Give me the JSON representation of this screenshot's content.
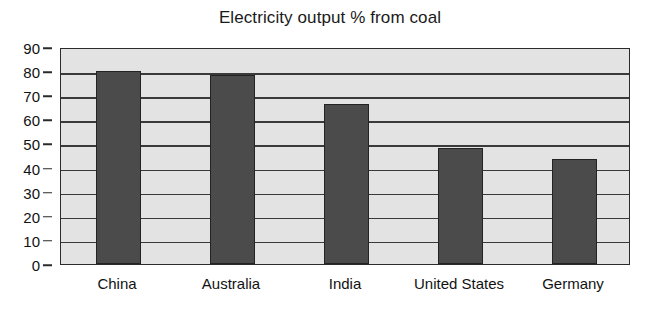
{
  "chart_data": {
    "type": "bar",
    "title": "Electricity output % from coal",
    "xlabel": "",
    "ylabel": "",
    "categories": [
      "China",
      "Australia",
      "India",
      "United States",
      "Germany"
    ],
    "values": [
      80,
      78.5,
      66.5,
      48,
      43.5
    ],
    "ylim": [
      0,
      90
    ],
    "ytick_step": 10,
    "yticks": [
      0,
      10,
      20,
      30,
      40,
      50,
      60,
      70,
      80,
      90
    ],
    "ytick_labels": [
      "0",
      "10",
      "20",
      "30",
      "40",
      "50",
      "60",
      "70",
      "80",
      "90"
    ],
    "grid": true,
    "grid_axis": "y",
    "legend": false,
    "legend_position": "none",
    "series": [
      {
        "name": "Electricity output % from coal",
        "values": [
          80,
          78.5,
          66.5,
          48,
          43.5
        ]
      }
    ],
    "colors": {
      "bar_fill": "#4b4b4b",
      "bar_edge": "#232323",
      "plot_background": "#e3e3e3",
      "axis": "#2b2b2b",
      "gridline": "#3a3a3a",
      "text": "#121212",
      "figure_background": "#ffffff"
    }
  }
}
